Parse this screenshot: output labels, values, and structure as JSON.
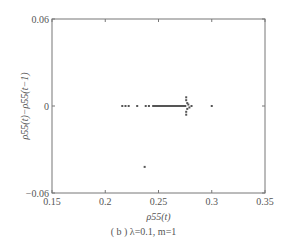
{
  "chart_data": {
    "type": "scatter",
    "title": "",
    "caption": "( b ) λ=0.1, m=1",
    "xlabel": "ρ55(t)",
    "ylabel": "ρ55(t)−ρ55(t−1)",
    "xlim": [
      0.15,
      0.35
    ],
    "ylim": [
      -0.06,
      0.06
    ],
    "x_ticks": [
      "0.15",
      "0.2",
      "0.25",
      "0.3",
      "0.35"
    ],
    "y_ticks": [
      "0.06",
      "0",
      "-0.06"
    ],
    "grid": false,
    "legend": null,
    "series": [
      {
        "name": "points",
        "points": [
          [
            0.216,
            0.0
          ],
          [
            0.219,
            0.0
          ],
          [
            0.222,
            0.0
          ],
          [
            0.23,
            0.0
          ],
          [
            0.238,
            0.0
          ],
          [
            0.241,
            0.0
          ],
          [
            0.245,
            0.0
          ],
          [
            0.247,
            0.0
          ],
          [
            0.249,
            0.0
          ],
          [
            0.251,
            0.0
          ],
          [
            0.253,
            0.0
          ],
          [
            0.255,
            0.0
          ],
          [
            0.257,
            0.0
          ],
          [
            0.259,
            0.0
          ],
          [
            0.261,
            0.0
          ],
          [
            0.263,
            0.0
          ],
          [
            0.265,
            0.0
          ],
          [
            0.267,
            0.0
          ],
          [
            0.269,
            0.0
          ],
          [
            0.271,
            0.0
          ],
          [
            0.273,
            0.0
          ],
          [
            0.275,
            0.0
          ],
          [
            0.276,
            0.006
          ],
          [
            0.276,
            0.004
          ],
          [
            0.277,
            0.002
          ],
          [
            0.277,
            -0.002
          ],
          [
            0.276,
            -0.004
          ],
          [
            0.276,
            -0.006
          ],
          [
            0.278,
            0.001
          ],
          [
            0.279,
            -0.001
          ],
          [
            0.281,
            0.0
          ],
          [
            0.3,
            0.0
          ],
          [
            0.237,
            -0.042
          ]
        ]
      }
    ]
  }
}
